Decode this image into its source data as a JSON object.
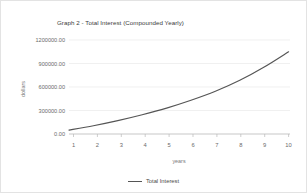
{
  "chart_data": {
    "type": "line",
    "title": "Graph 2 - Total Interest (Compounded Yearly)",
    "xlabel": "years",
    "ylabel": "dollars",
    "x": [
      1,
      2,
      3,
      4,
      5,
      6,
      7,
      8,
      9,
      10
    ],
    "categories": [
      "1",
      "2",
      "3",
      "4",
      "5",
      "6",
      "7",
      "8",
      "9",
      "10"
    ],
    "series": [
      {
        "name": "Total Interest",
        "color": "#555555",
        "values": [
          50000,
          105000,
          170000,
          245000,
          330000,
          430000,
          545000,
          685000,
          855000,
          1050000
        ]
      }
    ],
    "xlim": [
      1,
      10
    ],
    "ylim": [
      0,
      1200000
    ],
    "yticks": [
      0,
      300000,
      600000,
      900000,
      1200000
    ],
    "ytick_labels": [
      "0.00",
      "300000.00",
      "600000.00",
      "900000.00",
      "1200000.00"
    ],
    "xticks": [
      1,
      2,
      3,
      4,
      5,
      6,
      7,
      8,
      9,
      10
    ],
    "grid": true,
    "grid_axis": "y",
    "legend_position": "bottom"
  },
  "legend": {
    "entries": [
      {
        "label": "Total Interest",
        "color": "#555555"
      }
    ]
  },
  "colors": {
    "background": "#ffffff",
    "border": "#e3e3e3",
    "grid": "#e9e9e9",
    "axis": "#b9b9b9",
    "title_text": "#3b3b3b",
    "tick_text": "#6b6b6b",
    "axis_title_text": "#7a7a7a"
  }
}
